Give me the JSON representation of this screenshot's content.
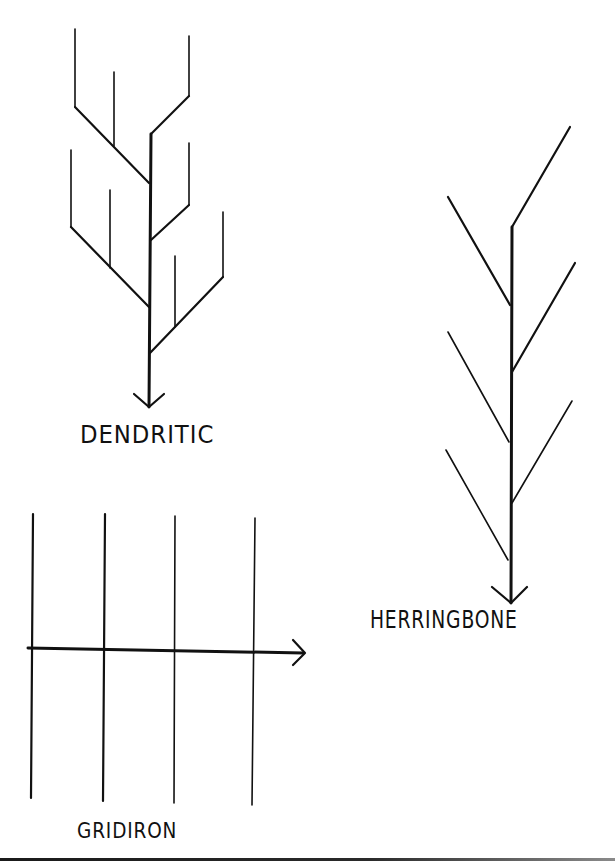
{
  "diagram": {
    "type": "drainage-patterns",
    "colors": {
      "ink": "#111111",
      "background": "#ffffff"
    },
    "patterns": [
      {
        "id": "dendritic",
        "label": "DENDRITIC",
        "description": "Tree-like branching network converging to a single trunk with a downward arrow"
      },
      {
        "id": "herringbone",
        "label": "HERRINGBONE",
        "description": "Central trunk with alternating angled side branches, arrow pointing down"
      },
      {
        "id": "gridiron",
        "label": "GRIDIRON",
        "description": "Four parallel vertical lines crossed by a horizontal line with an arrow pointing right"
      }
    ]
  }
}
